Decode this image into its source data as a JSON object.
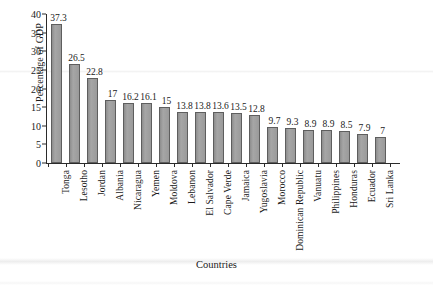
{
  "chart_data": {
    "type": "bar",
    "title": "",
    "xlabel": "Countries",
    "ylabel": "Percentage of GDP",
    "ylim": [
      0,
      40
    ],
    "yticks": [
      0,
      5,
      10,
      15,
      20,
      25,
      30,
      35,
      40
    ],
    "grid": false,
    "legend": null,
    "bar_color": "#9b9b9b",
    "bar_edge_color": "#5e5e5e",
    "axis_color": "#2b2b2b",
    "data_labels_shown": true,
    "categories": [
      "Tonga",
      "Lesotho",
      "Jordan",
      "Albania",
      "Nicaragua",
      "Yemen",
      "Moldova",
      "Lebanon",
      "El Salvador",
      "Cape Verde",
      "Jamaica",
      "Yugoslavia",
      "Morocco",
      "Dominican Republic",
      "Vanuatu",
      "Philippines",
      "Honduras",
      "Ecuador",
      "Sri Lanka"
    ],
    "values": [
      37.3,
      26.5,
      22.8,
      17,
      16.2,
      16.1,
      15,
      13.8,
      13.8,
      13.6,
      13.5,
      12.8,
      9.7,
      9.3,
      8.9,
      8.9,
      8.5,
      7.9,
      7
    ],
    "value_labels": [
      "37.3",
      "26.5",
      "22.8",
      "17",
      "16.2",
      "16.1",
      "15",
      "13.8",
      "13.8",
      "13.6",
      "13.5",
      "12.8",
      "9.7",
      "9.3",
      "8.9",
      "8.9",
      "8.5",
      "7.9",
      "7"
    ]
  }
}
